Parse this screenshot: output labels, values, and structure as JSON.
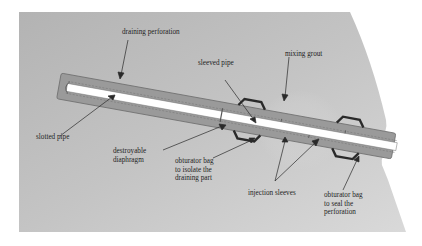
{
  "diagram": {
    "type": "cross-section schematic",
    "colors": {
      "background": "#ffffff",
      "rock": "#b9b9b9",
      "rock_light": "#d6d6d6",
      "perforation": "#9a9a9a",
      "pipe_bore": "#ffffff",
      "grout": "#cfcfcf",
      "bag": "#2a2a2a",
      "text": "#1e1e1e"
    },
    "labels": {
      "draining_perforation": "draining perforation",
      "mixing_grout": "mixing grout",
      "sleeved_pipe": "sleeved pipe",
      "slotted_pipe": "slotted pipe",
      "destroyable_diaphragm": "destroyable\ndiaphragm",
      "obturator_bag_isolate": "obturator bag\nto isolate the\ndraining part",
      "injection_sleeves": "injection sleeves",
      "obturator_bag_seal": "obturator bag\nto seal the\nperforation"
    }
  }
}
